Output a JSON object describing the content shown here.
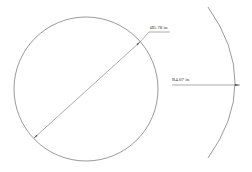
{
  "drawing": {
    "background": "#ffffff",
    "stroke_color": "#555555",
    "circle": {
      "cx": 86,
      "cy": 89,
      "r": 72,
      "diameter_dimension": {
        "label": "Ø5.78 in",
        "line": {
          "x1": 34,
          "y1": 138,
          "x2": 140,
          "y2": 42
        },
        "leader": {
          "x1": 140,
          "y1": 42,
          "x2": 149,
          "y2": 32,
          "x3": 170,
          "y3": 32
        },
        "label_x": 150,
        "label_y": 25
      }
    },
    "arc": {
      "start": {
        "x": 208,
        "y": 7
      },
      "control": {
        "x": 262,
        "y": 83
      },
      "end": {
        "x": 208,
        "y": 158
      },
      "radius_dimension": {
        "label": "R4.07 in",
        "line": {
          "x1": 172,
          "y1": 85,
          "x2": 240,
          "y2": 85
        },
        "label_x": 172,
        "label_y": 77
      }
    }
  }
}
